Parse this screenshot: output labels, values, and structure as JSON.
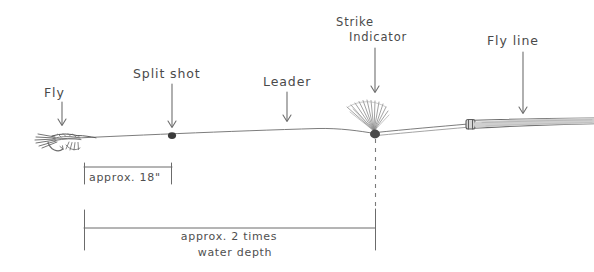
{
  "diagram": {
    "background_color": "#ffffff",
    "ink_color": "#4a4a4a",
    "labels": {
      "fly": "Fly",
      "split_shot": "Split shot",
      "leader": "Leader",
      "strike_indicator_line1": "Strike",
      "strike_indicator_line2": "Indicator",
      "fly_line": "Fly line"
    },
    "dimensions": {
      "short": "approx. 18\"",
      "long_line1": "approx. 2 times",
      "long_line2": "water depth"
    },
    "components": [
      {
        "name": "fly",
        "label": "Fly"
      },
      {
        "name": "split-shot",
        "label": "Split shot"
      },
      {
        "name": "leader",
        "label": "Leader"
      },
      {
        "name": "strike-indicator",
        "label": "Strike Indicator"
      },
      {
        "name": "fly-line",
        "label": "Fly line"
      }
    ]
  }
}
